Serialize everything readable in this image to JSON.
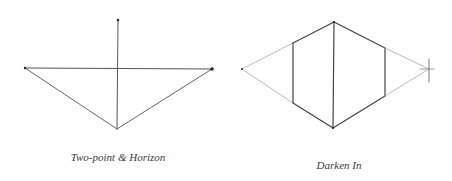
{
  "figures": [
    {
      "id": "two-point-horizon",
      "caption": "Two-point & Horizon",
      "caption_pos": [
        118,
        157
      ],
      "lines": [
        {
          "x1": 25,
          "y1": 68,
          "x2": 212,
          "y2": 69,
          "color": "#555555",
          "width": 1
        },
        {
          "x1": 118,
          "y1": 20,
          "x2": 117,
          "y2": 129,
          "color": "#555555",
          "width": 1
        },
        {
          "x1": 25,
          "y1": 68,
          "x2": 117,
          "y2": 129,
          "color": "#666666",
          "width": 1
        },
        {
          "x1": 212,
          "y1": 69,
          "x2": 117,
          "y2": 129,
          "color": "#666666",
          "width": 1
        }
      ],
      "points": [
        {
          "x": 25,
          "y": 68,
          "r": 1.2
        },
        {
          "x": 212,
          "y": 69,
          "r": 1.8
        },
        {
          "x": 118,
          "y": 20,
          "r": 1.2
        }
      ]
    },
    {
      "id": "darken-in",
      "caption": "Darken In",
      "caption_pos": [
        339,
        165
      ],
      "lines": [
        {
          "x1": 242,
          "y1": 69,
          "x2": 293,
          "y2": 43,
          "color": "#bbbbbb",
          "width": 1
        },
        {
          "x1": 242,
          "y1": 69,
          "x2": 293,
          "y2": 103,
          "color": "#bbbbbb",
          "width": 1
        },
        {
          "x1": 293,
          "y1": 43,
          "x2": 334,
          "y2": 22,
          "color": "#444444",
          "width": 1.2
        },
        {
          "x1": 334,
          "y1": 22,
          "x2": 385,
          "y2": 48,
          "color": "#444444",
          "width": 1.2
        },
        {
          "x1": 293,
          "y1": 103,
          "x2": 333,
          "y2": 128,
          "color": "#444444",
          "width": 1.2
        },
        {
          "x1": 333,
          "y1": 128,
          "x2": 385,
          "y2": 96,
          "color": "#444444",
          "width": 1.2
        },
        {
          "x1": 293,
          "y1": 43,
          "x2": 293,
          "y2": 103,
          "color": "#444444",
          "width": 1.2
        },
        {
          "x1": 334,
          "y1": 22,
          "x2": 333,
          "y2": 128,
          "color": "#444444",
          "width": 1.2
        },
        {
          "x1": 385,
          "y1": 48,
          "x2": 385,
          "y2": 96,
          "color": "#444444",
          "width": 1.2
        },
        {
          "x1": 385,
          "y1": 48,
          "x2": 429,
          "y2": 69,
          "color": "#bbbbbb",
          "width": 1
        },
        {
          "x1": 385,
          "y1": 96,
          "x2": 429,
          "y2": 69,
          "color": "#bbbbbb",
          "width": 1
        },
        {
          "x1": 429,
          "y1": 59,
          "x2": 429,
          "y2": 82,
          "color": "#777777",
          "width": 1
        },
        {
          "x1": 420,
          "y1": 69,
          "x2": 434,
          "y2": 69,
          "color": "#999999",
          "width": 1
        }
      ],
      "points": [
        {
          "x": 242,
          "y": 69,
          "r": 1
        },
        {
          "x": 334,
          "y": 22,
          "r": 1
        },
        {
          "x": 333,
          "y": 128,
          "r": 1
        }
      ]
    }
  ]
}
